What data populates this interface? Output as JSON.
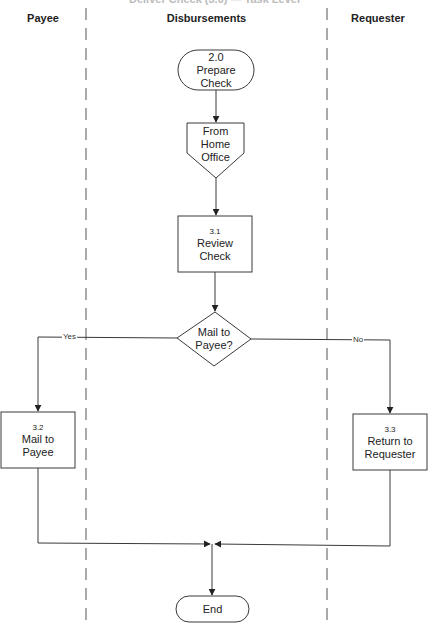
{
  "title": "Deliver Check (3.0) — Task Level",
  "lanes": [
    {
      "name": "Payee"
    },
    {
      "name": "Disbursements"
    },
    {
      "name": "Requester"
    }
  ],
  "nodes": {
    "start": {
      "type": "terminal",
      "lines": [
        "2.0",
        "Prepare",
        "Check"
      ]
    },
    "connector": {
      "type": "off-page-connector",
      "lines": [
        "From",
        "Home",
        "Office"
      ]
    },
    "review": {
      "type": "process",
      "number": "3.1",
      "lines": [
        "Review",
        "Check"
      ]
    },
    "decision": {
      "type": "decision",
      "lines": [
        "Mail to",
        "Payee?"
      ]
    },
    "mail": {
      "type": "process",
      "number": "3.2",
      "lines": [
        "Mail to",
        "Payee"
      ]
    },
    "return": {
      "type": "process",
      "number": "3.3",
      "lines": [
        "Return to",
        "Requester"
      ]
    },
    "end": {
      "type": "terminal",
      "label": "End"
    }
  },
  "edges": {
    "yes_label": "Yes",
    "no_label": "No"
  },
  "colors": {
    "stroke": "#3a3a3a",
    "lane_divider": "#555555",
    "background": "#ffffff"
  }
}
